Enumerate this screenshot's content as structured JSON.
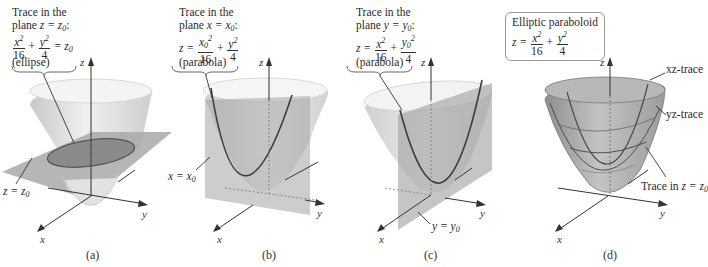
{
  "figure": {
    "colors": {
      "surface_light": "#e6e6e6",
      "surface_mid": "#c9c9c9",
      "surface_dark": "#9a9a9a",
      "plane": "#a8a8a8",
      "trace_curve": "#4a4a4a",
      "axis": "#333333",
      "background": "#ffffff"
    },
    "panels": [
      {
        "id": "a",
        "caption": "(a)",
        "title_line1": "Trace in the",
        "title_line2_prefix": "plane ",
        "title_line2_eq": "z = z",
        "title_line2_sub": "0",
        "title_line2_suffix": ":",
        "equation": {
          "t1_num": "x",
          "t1_num_sup": "2",
          "t1_den": "16",
          "op": "+",
          "t2_num": "y",
          "t2_num_sup": "2",
          "t2_den": "4",
          "rhs": "= z",
          "rhs_sub": "0"
        },
        "curve_type": "(ellipse)",
        "plane_label": "z = z",
        "plane_label_sub": "0",
        "axes": {
          "z": "z",
          "y": "y",
          "x": "x"
        }
      },
      {
        "id": "b",
        "caption": "(b)",
        "title_line1": "Trace in the",
        "title_line2_prefix": "plane ",
        "title_line2_eq": "x = x",
        "title_line2_sub": "0",
        "title_line2_suffix": ":",
        "equation": {
          "lhs": "z =",
          "t1_num": "x",
          "t1_num_sub": "0",
          "t1_num_sup": "2",
          "t1_den": "16",
          "op": "+",
          "t2_num": "y",
          "t2_num_sup": "2",
          "t2_den": "4"
        },
        "curve_type": "(parabola)",
        "plane_label": "x = x",
        "plane_label_sub": "0",
        "axes": {
          "z": "z",
          "y": "y",
          "x": "x"
        }
      },
      {
        "id": "c",
        "caption": "(c)",
        "title_line1": "Trace in the",
        "title_line2_prefix": "plane ",
        "title_line2_eq": "y = y",
        "title_line2_sub": "0",
        "title_line2_suffix": ":",
        "equation": {
          "lhs": "z =",
          "t1_num": "x",
          "t1_num_sup": "2",
          "t1_den": "16",
          "op": "+",
          "t2_num": "y",
          "t2_num_sub": "0",
          "t2_num_sup": "2",
          "t2_den": "4"
        },
        "curve_type": "(parabola)",
        "plane_label": "y = y",
        "plane_label_sub": "0",
        "axes": {
          "z": "z",
          "y": "y",
          "x": "x"
        }
      },
      {
        "id": "d",
        "caption": "(d)",
        "box_title": "Elliptic paraboloid",
        "equation": {
          "lhs": "z =",
          "t1_num": "x",
          "t1_num_sup": "2",
          "t1_den": "16",
          "op": "+",
          "t2_num": "y",
          "t2_num_sup": "2",
          "t2_den": "4"
        },
        "annotations": {
          "xz_trace": "xz-trace",
          "yz_trace": "yz-trace",
          "trace_z_prefix": "Trace in ",
          "trace_z_eq": "z = z",
          "trace_z_sub": "0"
        },
        "axes": {
          "z": "z",
          "y": "y",
          "x": "x"
        }
      }
    ]
  }
}
